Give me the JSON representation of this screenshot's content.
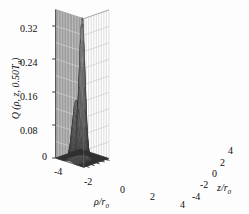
{
  "figure": {
    "kind": "3d-surface-plot",
    "background_color": "#fdfdfd",
    "wall_left_color": "#9d9d9d",
    "wall_right_color": "#ffffff",
    "grid_color_left": "#d8d8d8",
    "grid_color_right": "#c4c4c4",
    "mesh_color": "#3a3a3a",
    "floor_color": "#5a5a5a"
  },
  "axes": {
    "vertical": {
      "title_parts": {
        "quantity": "Q",
        "open": " (",
        "rho": "ρ",
        "comma1": ", ",
        "z": "z",
        "comma2": ", ",
        "value": "0.50",
        "temp": "T",
        "temp_sub": "0",
        "close": ")"
      },
      "title_plain": "Q (ρ, z, 0.50T₀)",
      "ticks": [
        "0",
        "0.08",
        "0.16",
        "0.24",
        "0.32"
      ],
      "tick_values": [
        0,
        0.08,
        0.16,
        0.24,
        0.32
      ],
      "range": [
        0,
        0.36
      ]
    },
    "rho": {
      "title_plain": "ρ/r₀",
      "symbol": "ρ",
      "slash": "/",
      "r": "r",
      "r_sub": "0",
      "ticks": [
        "-4",
        "-2",
        "0",
        "2",
        "4"
      ],
      "tick_values": [
        -4,
        -2,
        0,
        2,
        4
      ],
      "range": [
        -5,
        5
      ]
    },
    "z": {
      "title_plain": "z/r₀",
      "symbol": "z",
      "slash": "/",
      "r": "r",
      "r_sub": "0",
      "ticks": [
        "4",
        "2",
        "0",
        "-2",
        "-4"
      ],
      "tick_values": [
        4,
        2,
        0,
        -2,
        -4
      ],
      "range": [
        -5,
        5
      ]
    }
  },
  "chart_data": {
    "type": "surface",
    "title": "",
    "xlabel": "ρ/r₀",
    "ylabel": "z/r₀",
    "zlabel": "Q (ρ, z, 0.50T₀)",
    "xlim": [
      -5,
      5
    ],
    "ylim": [
      -5,
      5
    ],
    "zlim": [
      0,
      0.36
    ],
    "xticks": [
      -4,
      -2,
      0,
      2,
      4
    ],
    "yticks": [
      4,
      2,
      0,
      -2,
      -4
    ],
    "zticks": [
      0,
      0.08,
      0.16,
      0.24,
      0.32
    ],
    "grid": true,
    "legend": "none",
    "mesh": "wireframe",
    "peak_value": 0.345,
    "secondary_peak_value": 0.155,
    "baseline_value": 0.005,
    "peak_position": {
      "rho": 0.0,
      "z": 0.0
    },
    "secondary_peak_position": {
      "rho": 0.0,
      "z": 2.4
    },
    "surface_model": {
      "form": "a*exp(-(rho^2+z^2)/w1^2) + b*exp(-(rho^2+(z-z0)^2)/w2^2)",
      "a": 0.335,
      "w1": 1.05,
      "b": 0.145,
      "w2": 1.35,
      "z0": 2.45
    },
    "grid_n": 46
  },
  "tick_positions": {
    "vertical": [
      {
        "label": "0.32",
        "x": 20,
        "y": 24
      },
      {
        "label": "0.24",
        "x": 20,
        "y": 58
      },
      {
        "label": "0.16",
        "x": 20,
        "y": 92
      },
      {
        "label": "0.08",
        "x": 20,
        "y": 126
      },
      {
        "label": "0",
        "x": 42,
        "y": 152
      }
    ],
    "rho": [
      {
        "label": "-4",
        "x": 54,
        "y": 167
      },
      {
        "label": "-2",
        "x": 84,
        "y": 177
      },
      {
        "label": "0",
        "x": 120,
        "y": 185
      },
      {
        "label": "2",
        "x": 150,
        "y": 192
      },
      {
        "label": "4",
        "x": 180,
        "y": 200
      }
    ],
    "z": [
      {
        "label": "4",
        "x": 228,
        "y": 146
      },
      {
        "label": "2",
        "x": 220,
        "y": 158
      },
      {
        "label": "0",
        "x": 212,
        "y": 169
      },
      {
        "label": "-2",
        "x": 200,
        "y": 180
      },
      {
        "label": "-4",
        "x": 192,
        "y": 192
      }
    ]
  },
  "axis_title_positions": {
    "rho": {
      "x": 94,
      "y": 197
    },
    "z": {
      "x": 217,
      "y": 183
    }
  }
}
